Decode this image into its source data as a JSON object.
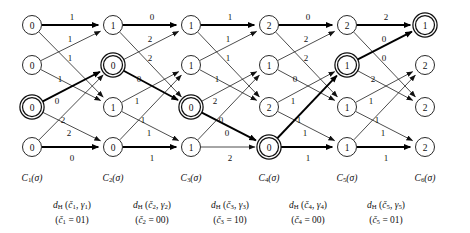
{
  "figure": {
    "type": "trellis-diagram",
    "columns": 6,
    "rows": 4,
    "node_radius": 9.5,
    "highlight_style": "double-circle",
    "colors": {
      "stroke": "#111111",
      "survivor": "#000000",
      "background": "#ffffff"
    }
  },
  "columns": [
    {
      "id": "c1",
      "x": 32,
      "label_main": "C",
      "label_sub": "1",
      "label_tail": "(σ)",
      "nodes": [
        {
          "row": 0,
          "y": 25,
          "value": "0",
          "highlighted": false
        },
        {
          "row": 1,
          "y": 65,
          "value": "0",
          "highlighted": false
        },
        {
          "row": 2,
          "y": 107,
          "value": "0",
          "highlighted": true
        },
        {
          "row": 3,
          "y": 147,
          "value": "0",
          "highlighted": false
        }
      ]
    },
    {
      "id": "c2",
      "x": 113,
      "label_main": "C",
      "label_sub": "2",
      "label_tail": "(σ)",
      "nodes": [
        {
          "row": 0,
          "y": 25,
          "value": "1",
          "highlighted": false
        },
        {
          "row": 1,
          "y": 65,
          "value": "0",
          "highlighted": true
        },
        {
          "row": 2,
          "y": 107,
          "value": "1",
          "highlighted": false
        },
        {
          "row": 3,
          "y": 147,
          "value": "0",
          "highlighted": false
        }
      ]
    },
    {
      "id": "c3",
      "x": 191,
      "label_main": "C",
      "label_sub": "3",
      "label_tail": "(σ)",
      "nodes": [
        {
          "row": 0,
          "y": 25,
          "value": "1",
          "highlighted": false
        },
        {
          "row": 1,
          "y": 65,
          "value": "1",
          "highlighted": false
        },
        {
          "row": 2,
          "y": 107,
          "value": "0",
          "highlighted": true
        },
        {
          "row": 3,
          "y": 147,
          "value": "1",
          "highlighted": false
        }
      ]
    },
    {
      "id": "c4",
      "x": 269,
      "label_main": "C",
      "label_sub": "4",
      "label_tail": "(σ)",
      "nodes": [
        {
          "row": 0,
          "y": 25,
          "value": "2",
          "highlighted": false
        },
        {
          "row": 1,
          "y": 65,
          "value": "1",
          "highlighted": false
        },
        {
          "row": 2,
          "y": 107,
          "value": "2",
          "highlighted": false
        },
        {
          "row": 3,
          "y": 147,
          "value": "0",
          "highlighted": true
        }
      ]
    },
    {
      "id": "c5",
      "x": 347,
      "label_main": "C",
      "label_sub": "5",
      "label_tail": "(σ)",
      "nodes": [
        {
          "row": 0,
          "y": 25,
          "value": "2",
          "highlighted": false
        },
        {
          "row": 1,
          "y": 65,
          "value": "1",
          "highlighted": true
        },
        {
          "row": 2,
          "y": 107,
          "value": "1",
          "highlighted": false
        },
        {
          "row": 3,
          "y": 147,
          "value": "1",
          "highlighted": false
        }
      ]
    },
    {
      "id": "c6",
      "x": 425,
      "label_main": "C",
      "label_sub": "6",
      "label_tail": "(σ)",
      "nodes": [
        {
          "row": 0,
          "y": 25,
          "value": "1",
          "highlighted": true
        },
        {
          "row": 1,
          "y": 65,
          "value": "2",
          "highlighted": false
        },
        {
          "row": 2,
          "y": 107,
          "value": "2",
          "highlighted": false
        },
        {
          "row": 3,
          "y": 147,
          "value": "2",
          "highlighted": false
        }
      ]
    }
  ],
  "stages": [
    {
      "id": "s1",
      "from": "c1",
      "to": "c2",
      "edges": [
        {
          "from_row": 0,
          "to_row": 0,
          "label": "1",
          "lx": 72,
          "ly": 17,
          "survivor": true
        },
        {
          "from_row": 0,
          "to_row": 2,
          "label": "1",
          "lx": 70,
          "ly": 39,
          "survivor": false
        },
        {
          "from_row": 1,
          "to_row": 0,
          "label": "1",
          "lx": 70,
          "ly": 58,
          "survivor": false
        },
        {
          "from_row": 1,
          "to_row": 2,
          "label": "1",
          "lx": 60,
          "ly": 79,
          "survivor": false
        },
        {
          "from_row": 2,
          "to_row": 1,
          "label": "0",
          "lx": 57,
          "ly": 101,
          "survivor": true
        },
        {
          "from_row": 2,
          "to_row": 3,
          "label": "2",
          "lx": 63,
          "ly": 120,
          "survivor": false
        },
        {
          "from_row": 3,
          "to_row": 1,
          "label": "2",
          "lx": 69,
          "ly": 133,
          "survivor": false
        },
        {
          "from_row": 3,
          "to_row": 3,
          "label": "0",
          "lx": 72,
          "ly": 158,
          "survivor": true
        }
      ]
    },
    {
      "id": "s2",
      "from": "c2",
      "to": "c3",
      "edges": [
        {
          "from_row": 0,
          "to_row": 0,
          "label": "0",
          "lx": 152,
          "ly": 17,
          "survivor": true
        },
        {
          "from_row": 0,
          "to_row": 2,
          "label": "2",
          "lx": 150,
          "ly": 39,
          "survivor": false
        },
        {
          "from_row": 1,
          "to_row": 0,
          "label": "2",
          "lx": 150,
          "ly": 58,
          "survivor": false
        },
        {
          "from_row": 1,
          "to_row": 2,
          "label": "0",
          "lx": 139,
          "ly": 79,
          "survivor": true
        },
        {
          "from_row": 2,
          "to_row": 1,
          "label": "1",
          "lx": 137,
          "ly": 101,
          "survivor": false
        },
        {
          "from_row": 2,
          "to_row": 3,
          "label": "1",
          "lx": 143,
          "ly": 120,
          "survivor": false
        },
        {
          "from_row": 3,
          "to_row": 1,
          "label": "1",
          "lx": 149,
          "ly": 133,
          "survivor": false
        },
        {
          "from_row": 3,
          "to_row": 3,
          "label": "1",
          "lx": 152,
          "ly": 158,
          "survivor": true
        }
      ]
    },
    {
      "id": "s3",
      "from": "c3",
      "to": "c4",
      "edges": [
        {
          "from_row": 0,
          "to_row": 0,
          "label": "1",
          "lx": 230,
          "ly": 17,
          "survivor": true
        },
        {
          "from_row": 0,
          "to_row": 2,
          "label": "1",
          "lx": 228,
          "ly": 39,
          "survivor": false
        },
        {
          "from_row": 1,
          "to_row": 0,
          "label": "1",
          "lx": 228,
          "ly": 58,
          "survivor": false
        },
        {
          "from_row": 1,
          "to_row": 2,
          "label": "1",
          "lx": 217,
          "ly": 79,
          "survivor": false
        },
        {
          "from_row": 2,
          "to_row": 1,
          "label": "2",
          "lx": 215,
          "ly": 101,
          "survivor": false
        },
        {
          "from_row": 2,
          "to_row": 3,
          "label": "0",
          "lx": 221,
          "ly": 120,
          "survivor": true
        },
        {
          "from_row": 3,
          "to_row": 1,
          "label": "0",
          "lx": 227,
          "ly": 133,
          "survivor": false
        },
        {
          "from_row": 3,
          "to_row": 3,
          "label": "2",
          "lx": 230,
          "ly": 158,
          "survivor": false
        }
      ]
    },
    {
      "id": "s4",
      "from": "c4",
      "to": "c5",
      "edges": [
        {
          "from_row": 0,
          "to_row": 0,
          "label": "0",
          "lx": 308,
          "ly": 17,
          "survivor": true
        },
        {
          "from_row": 0,
          "to_row": 2,
          "label": "2",
          "lx": 306,
          "ly": 39,
          "survivor": false
        },
        {
          "from_row": 1,
          "to_row": 0,
          "label": "2",
          "lx": 306,
          "ly": 58,
          "survivor": false
        },
        {
          "from_row": 1,
          "to_row": 2,
          "label": "0",
          "lx": 295,
          "ly": 79,
          "survivor": false
        },
        {
          "from_row": 2,
          "to_row": 1,
          "label": "1",
          "lx": 293,
          "ly": 101,
          "survivor": false
        },
        {
          "from_row": 2,
          "to_row": 3,
          "label": "1",
          "lx": 299,
          "ly": 120,
          "survivor": false
        },
        {
          "from_row": 3,
          "to_row": 1,
          "label": "1",
          "lx": 305,
          "ly": 133,
          "survivor": true
        },
        {
          "from_row": 3,
          "to_row": 3,
          "label": "1",
          "lx": 308,
          "ly": 158,
          "survivor": true
        }
      ]
    },
    {
      "id": "s5",
      "from": "c5",
      "to": "c6",
      "edges": [
        {
          "from_row": 0,
          "to_row": 0,
          "label": "2",
          "lx": 386,
          "ly": 17,
          "survivor": true
        },
        {
          "from_row": 0,
          "to_row": 2,
          "label": "0",
          "lx": 384,
          "ly": 39,
          "survivor": false
        },
        {
          "from_row": 1,
          "to_row": 0,
          "label": "0",
          "lx": 384,
          "ly": 58,
          "survivor": true
        },
        {
          "from_row": 1,
          "to_row": 2,
          "label": "2",
          "lx": 373,
          "ly": 79,
          "survivor": false
        },
        {
          "from_row": 2,
          "to_row": 1,
          "label": "1",
          "lx": 371,
          "ly": 101,
          "survivor": false
        },
        {
          "from_row": 2,
          "to_row": 3,
          "label": "1",
          "lx": 377,
          "ly": 120,
          "survivor": false
        },
        {
          "from_row": 3,
          "to_row": 1,
          "label": "1",
          "lx": 383,
          "ly": 133,
          "survivor": false
        },
        {
          "from_row": 3,
          "to_row": 3,
          "label": "1",
          "lx": 386,
          "ly": 158,
          "survivor": true
        }
      ]
    }
  ],
  "column_labels": [
    {
      "x": 32,
      "y": 173,
      "main": "C",
      "sub": "1",
      "tail": "(σ)"
    },
    {
      "x": 113,
      "y": 173,
      "main": "C",
      "sub": "2",
      "tail": "(σ)"
    },
    {
      "x": 191,
      "y": 173,
      "main": "C",
      "sub": "3",
      "tail": "(σ)"
    },
    {
      "x": 269,
      "y": 173,
      "main": "C",
      "sub": "4",
      "tail": "(σ)"
    },
    {
      "x": 347,
      "y": 173,
      "main": "C",
      "sub": "5",
      "tail": "(σ)"
    },
    {
      "x": 425,
      "y": 173,
      "main": "C",
      "sub": "6",
      "tail": "(σ)"
    }
  ],
  "metric_labels": [
    {
      "x": 72,
      "y": 198,
      "d": "d",
      "dsub": "H",
      "arg1": "č",
      "arg1sub": "1",
      "arg2": "γ",
      "arg2sub": "1",
      "cw_sym": "č",
      "cw_sub": "1",
      "cw_val": "01"
    },
    {
      "x": 152,
      "y": 198,
      "d": "d",
      "dsub": "H",
      "arg1": "č",
      "arg1sub": "2",
      "arg2": "γ",
      "arg2sub": "2",
      "cw_sym": "č",
      "cw_sub": "2",
      "cw_val": "00"
    },
    {
      "x": 230,
      "y": 198,
      "d": "d",
      "dsub": "H",
      "arg1": "č",
      "arg1sub": "3",
      "arg2": "γ",
      "arg2sub": "3",
      "cw_sym": "č",
      "cw_sub": "3",
      "cw_val": "10"
    },
    {
      "x": 308,
      "y": 198,
      "d": "d",
      "dsub": "H",
      "arg1": "č",
      "arg1sub": "4",
      "arg2": "γ",
      "arg2sub": "4",
      "cw_sym": "č",
      "cw_sub": "4",
      "cw_val": "00"
    },
    {
      "x": 386,
      "y": 198,
      "d": "d",
      "dsub": "H",
      "arg1": "č",
      "arg1sub": "5",
      "arg2": "γ",
      "arg2sub": "5",
      "cw_sym": "č",
      "cw_sub": "5",
      "cw_val": "01"
    }
  ]
}
